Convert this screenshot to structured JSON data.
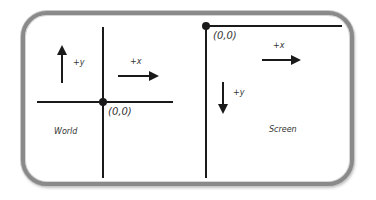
{
  "diagram": {
    "colors": {
      "frame": "#8a8a8a",
      "axis": "#1a1a1a",
      "text": "#333333",
      "background": "#ffffff"
    },
    "panels": [
      {
        "name": "World",
        "label": "World",
        "origin_label": "(0,0)",
        "origin_position": "center",
        "x_axis_label": "+x",
        "x_direction": "right",
        "y_axis_label": "+y",
        "y_direction": "up"
      },
      {
        "name": "Screen",
        "label": "Screen",
        "origin_label": "(0,0)",
        "origin_position": "top-left",
        "x_axis_label": "+x",
        "x_direction": "right",
        "y_axis_label": "+y",
        "y_direction": "down"
      }
    ]
  }
}
